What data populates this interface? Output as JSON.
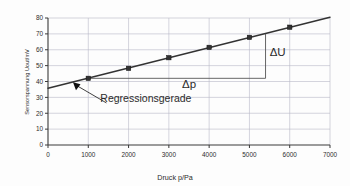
{
  "chart_data": {
    "type": "scatter",
    "title": "",
    "xlabel": "Druck p/Pa",
    "ylabel": "Sensorspannung Uout/mV",
    "xlim": [
      0,
      7000
    ],
    "ylim": [
      0,
      80
    ],
    "xticks": [
      "0",
      "1000",
      "2000",
      "3000",
      "4000",
      "5000",
      "6000",
      "7000"
    ],
    "xtick_values": [
      0,
      1000,
      2000,
      3000,
      4000,
      5000,
      6000,
      7000
    ],
    "yticks": [
      "0",
      "10",
      "20",
      "30",
      "40",
      "50",
      "60",
      "70",
      "80"
    ],
    "ytick_values": [
      0,
      10,
      20,
      30,
      40,
      50,
      60,
      70,
      80
    ],
    "grid": true,
    "legend": "none",
    "series": [
      {
        "name": "Messwerte",
        "marker": "square",
        "color": "#333333",
        "x": [
          1000,
          2000,
          3000,
          4000,
          5000,
          6000
        ],
        "values": [
          42.0,
          48.3,
          55.0,
          61.5,
          67.8,
          74.2
        ]
      },
      {
        "name": "Regressionsgerade",
        "type": "line",
        "color": "#333333",
        "x": [
          0,
          7000
        ],
        "values": [
          35.8,
          80.5
        ]
      }
    ],
    "annotations": [
      {
        "name": "regression-label",
        "text": "Regressionsgerade",
        "x": 1300,
        "y": 27
      },
      {
        "name": "delta-u-label",
        "text": "ΔU",
        "x": 5700,
        "y": 56
      },
      {
        "name": "delta-p-label",
        "text": "Δp",
        "x": 3500,
        "y": 36
      }
    ],
    "slope_triangle": {
      "name": "slope-triangle",
      "x_start": 1000,
      "x_end": 5400,
      "y_base": 42.0,
      "y_top": 70.0
    },
    "colors": {
      "axis": "#3a3a3a",
      "grid": "#b8b8c8",
      "data": "#333333",
      "line": "#333333",
      "text": "#2b2b2b",
      "background": "#fdfdfd"
    }
  },
  "axis_labels": {
    "x": "Druck p/Pa",
    "y": "Sensorspannung Uout/mV"
  }
}
